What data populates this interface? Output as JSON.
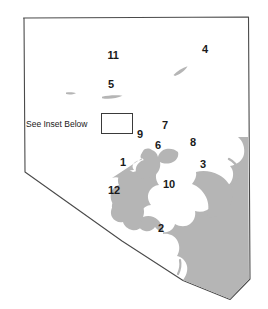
{
  "figure": {
    "type": "map",
    "width": 268,
    "height": 309,
    "background_color": "#ffffff"
  },
  "colors": {
    "boundary_stroke": "#4a4a4a",
    "water_fill": "#b5b5b5",
    "label_text": "#1a1a1a",
    "inset_box_stroke": "#3a3a3a",
    "page_background": "#ffffff"
  },
  "annotations": {
    "inset_note": {
      "label": "See Inset Below",
      "x": 26,
      "y": 124,
      "font_size": 8.5
    },
    "inset_box": {
      "name": "inset-extent-rectangle",
      "x": 101,
      "y": 113,
      "width": 32,
      "height": 21
    }
  },
  "site_labels": [
    {
      "id": "11",
      "label": "11",
      "x": 113,
      "y": 55
    },
    {
      "id": "4",
      "label": "4",
      "x": 205,
      "y": 49
    },
    {
      "id": "5",
      "label": "5",
      "x": 111,
      "y": 84
    },
    {
      "id": "9",
      "label": "9",
      "x": 140,
      "y": 134
    },
    {
      "id": "7",
      "label": "7",
      "x": 165,
      "y": 125
    },
    {
      "id": "6",
      "label": "6",
      "x": 158,
      "y": 145
    },
    {
      "id": "8",
      "label": "8",
      "x": 193,
      "y": 142
    },
    {
      "id": "1",
      "label": "1",
      "x": 123,
      "y": 162
    },
    {
      "id": "3",
      "label": "3",
      "x": 203,
      "y": 164
    },
    {
      "id": "10",
      "label": "10",
      "x": 169,
      "y": 184
    },
    {
      "id": "12",
      "label": "12",
      "x": 114,
      "y": 190
    },
    {
      "id": "2",
      "label": "2",
      "x": 161,
      "y": 228
    }
  ],
  "geometry": {
    "county_boundary": "M 23.5,18 L 248,17.5 L 249.5,280 L 230,299 L 183,280 L 122,241 L 25,172 L 24.5,18 Z",
    "small_lakes": [
      {
        "name": "small-lake-north-west",
        "path": "M 66,93 C 69,92.2 73,92.4 75.5,93.2 C 73,94.4 68.5,94.5 66,93.8 Z"
      },
      {
        "name": "small-lake-near-5",
        "path": "M 103,97.5 C 108,96.2 116,95.4 122,96.2 C 116.5,98.6 108,99 103,98.4 Z"
      },
      {
        "name": "small-lake-north-east",
        "path": "M 174,74 C 177.5,70.5 183,67.8 187.5,66.6 C 185,70.6 180,74 175.8,75.2 Z"
      }
    ],
    "reservoir": "M 152,154 C 150,152 148,151 146.5,152.5 C 145,154 145.5,156.5 147,158 C 145,158.5 143,159 142,160.5 C 141,162 141.5,164 143,165 C 141,165.5 139.5,166.5 139,168 C 138.5,170 139.5,171.5 141,172 C 138,172.5 135,173 133,174.5 C 131,176 130,178 130.5,180 C 128,180 125.5,180.5 124,182 C 122.5,183.5 122.5,186 124,187.5 C 122,188 120.5,189.5 120.5,191.5 C 120.5,193.5 122,195 124,195.5 C 122.5,197 122,199 123,200.5 C 124,202 126,202.5 128,202 C 127,204 127.5,206 129,207 C 130.5,208 132.5,208 134,207 C 134.5,209 136,210.5 138,211 C 140,211.5 142,210.5 143,209 C 144,211 146,212 148,211.5 C 150,211 151.5,209.5 152,207.5 C 154,209 156.5,209 158,207.5 C 159.5,206 160,203.5 159,201.5 C 161.5,202 164,201 165,199 C 166,197 165.5,194.5 164,193 C 166.5,193 168.5,191.5 169,189.5 C 169.5,187.5 168.5,185.5 167,184.5 C 169,184 170.5,182.5 171,180.5 C 171.5,178.5 170.5,176.5 169,175.5 C 171.5,175.5 174,174.5 175,172.5 C 176,170.5 175.5,168 174,166.5 C 176.5,167 179,166 180,164 C 181,162 180.5,159.5 179,158 C 181,158 182.5,156.5 183,154.5 C 183.5,152.5 182.5,150.5 181,149.5 C 178,149 175,149.5 173,151 C 171,152.5 170,155 170.5,157 C 168,156 165.5,156 164,157.5 C 162.5,159 162,161.5 163,163.5 C 160.5,162.5 158,163 156.5,165 C 155,167 155,169.5 156.5,171 C 154,170.5 151.5,171.5 150.5,173.5 C 149.5,175.5 150,178 152,179 C 149.5,179 147,180 146,182 C 145,184 145.5,186.5 147.5,187.5 C 149.5,188.5 152,188 153.5,186.5 C 155,185 155.5,182.5 154.5,180.5 C 157,181 159.5,180 160.5,178 C 161.5,176 161,173.5 159,172.5 C 161.5,172.5 164,171.5 165,169.5 C 166,167.5 165.5,165 163.5,164 C 161.5,163 159,163.5 157.5,165 Z",
    "reservoir_main": "M 147,152 C 145,150.5 143,150.5 141.5,152 C 140,153.5 140,156 141.5,157.5 C 139,157.5 136.5,158.5 135.5,160.5 C 134.5,162.5 135,165 137,166 C 134,166.5 131,167.5 129,169.5 C 127,171.5 126,174.5 127,177 C 124,177 121,178 119,180 C 117,182 116,185 117,187.5 C 114.5,188.5 112.5,190.5 112,193 C 111.5,195.5 112.5,198 114.5,199.5 C 113,201.5 112.5,204 113.5,206.5 C 114.5,209 117,210.5 119.5,210.5 C 119,213 119.5,215.5 121.5,217.5 C 123.5,219.5 126.5,220 129,219 C 129.5,221.5 131,223.5 133.5,224.5 C 136,225.5 139,225 141,223 C 142,225.5 144.5,227 147,227 C 149.5,227 152,225.5 153,223 C 155,225 158,225.5 160.5,224.5 C 163,223.5 164.5,221 164.5,218.5 C 167,219.5 170,219 172,217 C 174,215 174.5,212 173.5,209.5 C 176.5,210 179.5,209 181.5,206.5 C 183.5,204 184,200.5 182.5,197.5 C 186,198 189.5,196.5 191.5,193.5 C 193.5,190.5 193.5,186.5 191.5,183.5 C 195,183.5 198.5,181.5 200,178.5 C 201.5,175.5 201,171.5 198.5,169 C 202,168.5 205,166 206,162.5 C 207,159 206,155.5 203.5,153 C 207,152 209.5,149 210,145.5 C 210.5,142 209,138.5 206,136.5 C 202,135 197.5,135.5 194.5,138 C 191.5,140.5 190.5,144.5 192,148 C 188,147 183.5,148 181,151 C 178.5,154 178,158 180,161.5 C 176,160.5 171.5,161.5 169,164.5 C 166.5,167.5 166,171.5 168,175 C 164,174 159.5,175 157,178 C 154.5,181 154,185 156,188.5 Z",
    "notes": "Large dendritic reservoir occupying the south-central and south-east of the county; numerous finger-like coves."
  },
  "chart_data": {
    "type": "map",
    "title": "",
    "legend": [],
    "site_count": 12,
    "sites": [
      "1",
      "2",
      "3",
      "4",
      "5",
      "6",
      "7",
      "8",
      "9",
      "10",
      "11",
      "12"
    ]
  }
}
